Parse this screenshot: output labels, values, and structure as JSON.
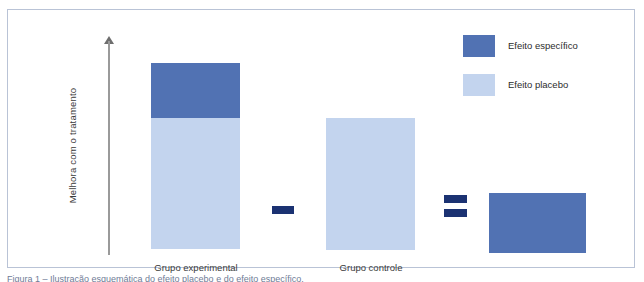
{
  "figure": {
    "y_axis_label": "Melhora com o tratamento",
    "caption": "Figura 1 – Ilustração esquemática do efeito placebo e do efeito específico.",
    "colors": {
      "specific_effect": "#5172b3",
      "placebo_effect": "#c3d4ee",
      "operator": "#1b3272",
      "frame_border": "#b9c3d6",
      "axis": "#9a9a9a",
      "text": "#2c2c2c"
    }
  },
  "legend": {
    "items": [
      {
        "label": "Efeito específico",
        "color": "#5172b3",
        "key": "specific"
      },
      {
        "label": "Efeito placebo",
        "color": "#c3d4ee",
        "key": "placebo"
      }
    ]
  },
  "operators": {
    "minus": "−",
    "equals": "="
  },
  "chart_data": {
    "type": "bar",
    "title": "",
    "subtitle": "",
    "xlabel": "",
    "ylabel": "Melhora com o tratamento",
    "grid": false,
    "legend_position": "top-right",
    "axis_has_arrow": true,
    "y_axis_ticks": [],
    "ylim": [
      0,
      100
    ],
    "categories": [
      "Grupo experimental",
      "Grupo controle",
      "Resultado"
    ],
    "series": [
      {
        "name": "Efeito placebo",
        "color": "#c3d4ee",
        "values": [
          70,
          71,
          0
        ]
      },
      {
        "name": "Efeito específico",
        "color": "#5172b3",
        "values": [
          30,
          0,
          32
        ]
      }
    ],
    "stacked": true,
    "equation": "Grupo experimental − Grupo controle = Efeito específico",
    "annotations": [
      {
        "text": "−",
        "between": [
          "Grupo experimental",
          "Grupo controle"
        ]
      },
      {
        "text": "=",
        "between": [
          "Grupo controle",
          "Resultado"
        ]
      }
    ],
    "bars": [
      {
        "category": "Grupo experimental",
        "label": "Grupo experimental",
        "segments": [
          {
            "name": "Efeito específico",
            "value": 30,
            "color": "#5172b3"
          },
          {
            "name": "Efeito placebo",
            "value": 70,
            "color": "#c3d4ee"
          }
        ],
        "total": 100
      },
      {
        "category": "Grupo controle",
        "label": "Grupo controle",
        "segments": [
          {
            "name": "Efeito placebo",
            "value": 71,
            "color": "#c3d4ee"
          }
        ],
        "total": 71
      },
      {
        "category": "Resultado",
        "label": "",
        "segments": [
          {
            "name": "Efeito específico",
            "value": 32,
            "color": "#5172b3"
          }
        ],
        "total": 32
      }
    ]
  }
}
